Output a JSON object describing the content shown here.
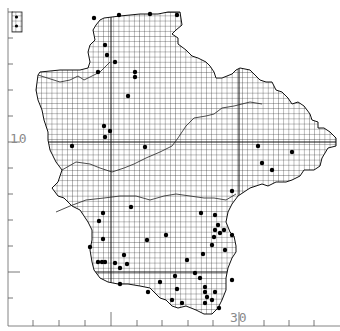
{
  "map": {
    "title": "",
    "type": "grid-square distribution map",
    "grid_unit_px": 5.15,
    "axis": {
      "x_label_text": "30",
      "y_label_text": "10",
      "x_ticks_px": [
        33,
        59,
        85,
        111,
        137,
        162,
        188,
        213,
        239,
        264,
        289,
        314
      ],
      "y_ticks_px": [
        12,
        38,
        64,
        90,
        116,
        142,
        168,
        194,
        220,
        246,
        272,
        298
      ],
      "x_major_tick_px": [
        111,
        239
      ],
      "y_major_tick_px": [
        142,
        272
      ]
    },
    "colors": {
      "grid": "#222222",
      "outline": "#111111",
      "dots": "#000000",
      "axis": "#555555",
      "labels": "#8a8a8a"
    },
    "records": [
      [
        150,
        14
      ],
      [
        119,
        15
      ],
      [
        177,
        15
      ],
      [
        94,
        18
      ],
      [
        105,
        45
      ],
      [
        107,
        55
      ],
      [
        115,
        62
      ],
      [
        98,
        72
      ],
      [
        135,
        72
      ],
      [
        135,
        77
      ],
      [
        128,
        96
      ],
      [
        104,
        126
      ],
      [
        110,
        131
      ],
      [
        105,
        137
      ],
      [
        72,
        146
      ],
      [
        145,
        147
      ],
      [
        258,
        146
      ],
      [
        292,
        152
      ],
      [
        262,
        163
      ],
      [
        272,
        170
      ],
      [
        232,
        191
      ],
      [
        131,
        207
      ],
      [
        103,
        213
      ],
      [
        201,
        213
      ],
      [
        99,
        221
      ],
      [
        215,
        215
      ],
      [
        218,
        225
      ],
      [
        215,
        230
      ],
      [
        220,
        233
      ],
      [
        214,
        237
      ],
      [
        224,
        230
      ],
      [
        212,
        245
      ],
      [
        232,
        235
      ],
      [
        225,
        250
      ],
      [
        103,
        239
      ],
      [
        166,
        235
      ],
      [
        105,
        262
      ],
      [
        124,
        255
      ],
      [
        90,
        247
      ],
      [
        147,
        240
      ],
      [
        115,
        263
      ],
      [
        127,
        264
      ],
      [
        203,
        254
      ],
      [
        120,
        268
      ],
      [
        187,
        260
      ],
      [
        102,
        262
      ],
      [
        98,
        262
      ],
      [
        195,
        273
      ],
      [
        175,
        276
      ],
      [
        200,
        278
      ],
      [
        205,
        287
      ],
      [
        205,
        292
      ],
      [
        207,
        297
      ],
      [
        212,
        300
      ],
      [
        215,
        292
      ],
      [
        172,
        300
      ],
      [
        182,
        303
      ],
      [
        205,
        303
      ],
      [
        160,
        282
      ],
      [
        177,
        289
      ],
      [
        120,
        284
      ],
      [
        148,
        292
      ],
      [
        232,
        280
      ],
      [
        219,
        308
      ]
    ],
    "outside_box": {
      "x": 12,
      "y": 12,
      "w": 10,
      "h": 20,
      "dots": [
        [
          16,
          17
        ],
        [
          16,
          26
        ]
      ]
    }
  }
}
